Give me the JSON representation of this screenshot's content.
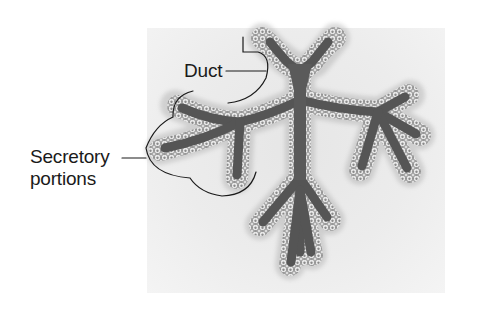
{
  "figure": {
    "labels": {
      "duct": "Duct",
      "secretory_line1": "Secretory",
      "secretory_line2": "portions"
    },
    "colors": {
      "background": "#ffffff",
      "panel": "#e9e9e9",
      "lumen": "#555555",
      "epithelium": "#d8d8d8",
      "cell_outline": "#6a6a6a",
      "leader_line": "#1a1a1a",
      "text": "#1a1a1a"
    }
  }
}
